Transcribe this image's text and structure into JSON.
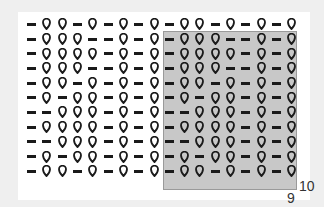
{
  "chart": {
    "title": "",
    "legend_symbols": {
      "-": "purl",
      "O": "yarn-over"
    },
    "rows": [
      "-OO-O-O-O-OO-O-O-O",
      "-OOO--O-O-OOO--O-O",
      "-OOOO-O-O-OOOO-O-O",
      "-OOO--O-O-OOO--O-O",
      "-OO-O-O-O-OO-O-O-O",
      "-O-OO-O-O-O-OO-O-O",
      "--OOO-O-O--OOO-O-O",
      "-OOOO-O-O-OOOO-O-O",
      "--OOO-O-O--OOO-O-O",
      "-O-OO-O-O-O-OO-O-O",
      "-OO-O-O-O-OO-O-O-O"
    ],
    "shaded_region": {
      "col_start": 10,
      "col_end": 18,
      "row_start": 2,
      "row_end": 11
    },
    "labels": {
      "row_count": "10",
      "stitch_count": "9"
    }
  }
}
